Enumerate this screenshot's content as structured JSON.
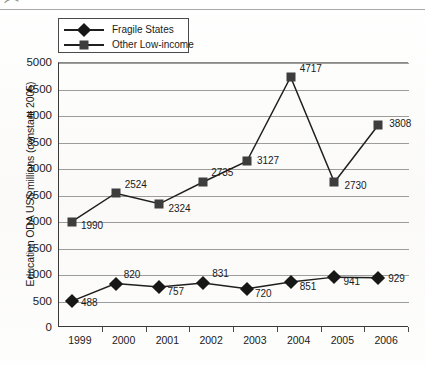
{
  "chart_data": {
    "type": "line",
    "title": "",
    "xlabel": "",
    "ylabel": "Education ODA US$ millions (constant 2005)",
    "categories": [
      "1999",
      "2000",
      "2001",
      "2002",
      "2003",
      "2004",
      "2005",
      "2006"
    ],
    "ylim": [
      0,
      5000
    ],
    "yticks": [
      "0",
      "500",
      "1000",
      "1500",
      "2000",
      "2500",
      "3000",
      "3500",
      "4000",
      "4500",
      "5000"
    ],
    "grid": "horizontal",
    "legend_position": "top-left",
    "series": [
      {
        "name": "Fragile States",
        "marker": "diamond",
        "color": "#171717",
        "values": [
          488,
          820,
          757,
          831,
          720,
          851,
          941,
          929
        ],
        "labels": [
          "488",
          "820",
          "757",
          "831",
          "720",
          "851",
          "941",
          "929"
        ]
      },
      {
        "name": "Other Low-income",
        "marker": "square",
        "color": "#3d3d3d",
        "values": [
          1990,
          2524,
          2324,
          2735,
          3127,
          4717,
          2730,
          3808
        ],
        "labels": [
          "1990",
          "2524",
          "2324",
          "2735",
          "3127",
          "4717",
          "2730",
          "3808"
        ]
      }
    ]
  },
  "legend": {
    "entries": [
      {
        "label": "Fragile States"
      },
      {
        "label": "Other Low-income"
      }
    ]
  },
  "artifacts": {
    "corner_glyph": "⌒"
  }
}
